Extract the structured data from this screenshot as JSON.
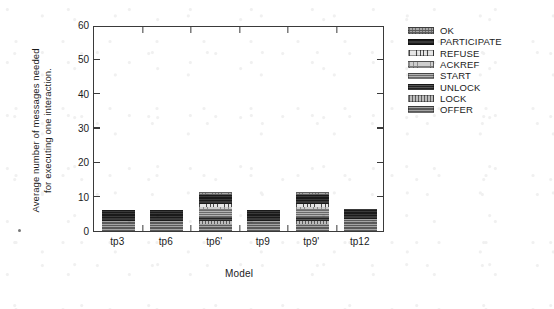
{
  "chart_data": {
    "type": "bar",
    "subtype": "stacked-bar",
    "title": "",
    "xlabel": "Model",
    "ylabel": "Average number of messages needed\nfor executing one interaction.",
    "categories": [
      "tp3",
      "tp6",
      "tp6'",
      "tp9",
      "tp9'",
      "tp12"
    ],
    "ylim": [
      0,
      60
    ],
    "yticks": [
      0,
      10,
      20,
      30,
      40,
      50,
      60
    ],
    "ytick_labels": [
      "0",
      "10",
      "20",
      "30",
      "40",
      "50",
      "60"
    ],
    "grid": false,
    "legend_position": "right-outside",
    "legend_order_top_to_bottom": [
      "OK",
      "PARTICIPATE",
      "REFUSE",
      "ACKREF",
      "START",
      "UNLOCK",
      "LOCK",
      "OFFER"
    ],
    "series": [
      {
        "name": "OFFER",
        "fill": "fill-offer",
        "values": [
          3.0,
          3.0,
          2.0,
          3.0,
          2.0,
          3.5
        ]
      },
      {
        "name": "LOCK",
        "fill": "fill-lock",
        "values": [
          0.0,
          0.0,
          1.0,
          0.0,
          1.0,
          0.0
        ]
      },
      {
        "name": "UNLOCK",
        "fill": "fill-unlock",
        "values": [
          0.0,
          0.0,
          1.0,
          0.0,
          1.0,
          0.0
        ]
      },
      {
        "name": "START",
        "fill": "fill-start",
        "values": [
          0.0,
          0.0,
          2.0,
          0.0,
          2.0,
          0.0
        ]
      },
      {
        "name": "ACKREF",
        "fill": "fill-ackref",
        "values": [
          0.0,
          0.0,
          1.0,
          0.0,
          1.0,
          0.0
        ]
      },
      {
        "name": "REFUSE",
        "fill": "fill-refuse",
        "values": [
          0.0,
          0.0,
          1.0,
          0.0,
          1.0,
          0.0
        ]
      },
      {
        "name": "PARTICIPATE",
        "fill": "fill-participate",
        "values": [
          3.0,
          3.0,
          2.5,
          3.0,
          2.5,
          3.0
        ]
      },
      {
        "name": "OK",
        "fill": "fill-ok",
        "values": [
          0.0,
          0.0,
          1.0,
          0.0,
          1.0,
          0.0
        ]
      }
    ],
    "totals": [
      6.0,
      6.0,
      11.5,
      6.0,
      11.5,
      6.5
    ]
  },
  "legend": {
    "items": [
      {
        "label": "OK",
        "swatch": "fill-ok"
      },
      {
        "label": "PARTICIPATE",
        "swatch": "fill-participate"
      },
      {
        "label": "REFUSE",
        "swatch": "fill-refuse"
      },
      {
        "label": "ACKREF",
        "swatch": "fill-ackref"
      },
      {
        "label": "START",
        "swatch": "fill-start"
      },
      {
        "label": "UNLOCK",
        "swatch": "fill-unlock"
      },
      {
        "label": "LOCK",
        "swatch": "fill-lock"
      },
      {
        "label": "OFFER",
        "swatch": "fill-offer"
      }
    ]
  },
  "colors": {
    "axis": "#3a3a3a",
    "text": "#1b1b1b",
    "background": "#ffffff"
  }
}
